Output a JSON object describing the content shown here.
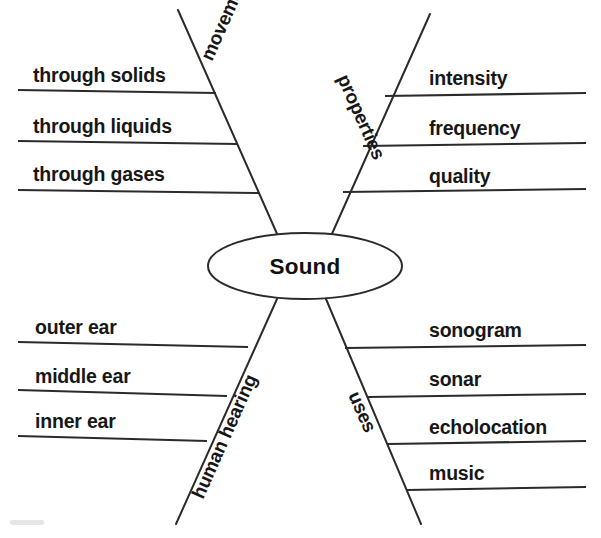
{
  "diagram": {
    "type": "concept-map",
    "title": "Sound",
    "center": {
      "label": "Sound",
      "shape": "ellipse",
      "cx": 305,
      "cy": 266,
      "rx": 97,
      "ry": 33
    },
    "stroke_color": "#2b2b2b",
    "text_color": "#171717",
    "background_color": "#ffffff",
    "branches": [
      {
        "id": "movement",
        "label": "movement",
        "position": "top-left",
        "label_rotation": -66,
        "label_x": 212,
        "label_y": 62,
        "line": {
          "x1": 178,
          "y1": 10,
          "x2": 278,
          "y2": 236
        },
        "leaves": [
          {
            "label": "through solids",
            "text_x": 33,
            "text_y": 82,
            "line_x1": 18,
            "line_y1": 90,
            "line_x2": 216,
            "line_y2": 93
          },
          {
            "label": "through liquids",
            "text_x": 33,
            "text_y": 133,
            "line_x1": 18,
            "line_y1": 141,
            "line_x2": 238,
            "line_y2": 144
          },
          {
            "label": "through gases",
            "text_x": 33,
            "text_y": 181,
            "line_x1": 18,
            "line_y1": 190,
            "line_x2": 259,
            "line_y2": 193
          }
        ]
      },
      {
        "id": "properties",
        "label": "properties",
        "position": "top-right",
        "label_rotation": 66,
        "label_x": 337,
        "label_y": 78,
        "line": {
          "x1": 430,
          "y1": 14,
          "x2": 331,
          "y2": 236
        },
        "leaves": [
          {
            "label": "intensity",
            "text_x": 429,
            "text_y": 85,
            "line_x1": 385,
            "line_y1": 96,
            "line_x2": 586,
            "line_y2": 93
          },
          {
            "label": "frequency",
            "text_x": 429,
            "text_y": 135,
            "line_x1": 363,
            "line_y1": 146,
            "line_x2": 586,
            "line_y2": 143
          },
          {
            "label": "quality",
            "text_x": 429,
            "text_y": 183,
            "line_x1": 343,
            "line_y1": 192,
            "line_x2": 586,
            "line_y2": 189
          }
        ]
      },
      {
        "id": "human-hearing",
        "label": "human hearing",
        "position": "bottom-left",
        "label_rotation": -66,
        "label_x": 203,
        "label_y": 500,
        "line": {
          "x1": 277,
          "y1": 299,
          "x2": 176,
          "y2": 524
        },
        "leaves": [
          {
            "label": "outer ear",
            "text_x": 35,
            "text_y": 334,
            "line_x1": 18,
            "line_y1": 342,
            "line_x2": 248,
            "line_y2": 347
          },
          {
            "label": "middle ear",
            "text_x": 35,
            "text_y": 383,
            "line_x1": 18,
            "line_y1": 390,
            "line_x2": 227,
            "line_y2": 396
          },
          {
            "label": "inner ear",
            "text_x": 35,
            "text_y": 428,
            "line_x1": 18,
            "line_y1": 436,
            "line_x2": 207,
            "line_y2": 441
          }
        ]
      },
      {
        "id": "uses",
        "label": "uses",
        "position": "bottom-right",
        "label_rotation": 66,
        "label_x": 348,
        "label_y": 395,
        "line": {
          "x1": 326,
          "y1": 299,
          "x2": 421,
          "y2": 524
        },
        "leaves": [
          {
            "label": "sonogram",
            "text_x": 429,
            "text_y": 337,
            "line_x1": 345,
            "line_y1": 348,
            "line_x2": 586,
            "line_y2": 345
          },
          {
            "label": "sonar",
            "text_x": 429,
            "text_y": 386,
            "line_x1": 368,
            "line_y1": 397,
            "line_x2": 586,
            "line_y2": 394
          },
          {
            "label": "echolocation",
            "text_x": 429,
            "text_y": 434,
            "line_x1": 388,
            "line_y1": 444,
            "line_x2": 586,
            "line_y2": 441
          },
          {
            "label": "music",
            "text_x": 429,
            "text_y": 480,
            "line_x1": 407,
            "line_y1": 490,
            "line_x2": 586,
            "line_y2": 487
          }
        ]
      }
    ]
  }
}
